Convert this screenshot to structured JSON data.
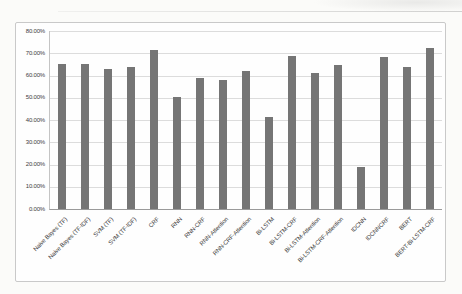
{
  "page": {
    "background": "#fbfbf9"
  },
  "chart": {
    "frame_border_color": "#c9c9c9",
    "plot_background": "#fefefe",
    "bar_color": "#757575",
    "gridline_color": "#dcdcdc",
    "axis_line_color": "#9a9a9a",
    "text_color": "#3d3d3d"
  },
  "chart_data": {
    "type": "bar",
    "title": "",
    "xlabel": "",
    "ylabel": "",
    "categories": [
      "Naive Bayes (TF)",
      "Naive Bayes (TF-IDF)",
      "SVM (TF)",
      "SVM (TF-IDF)",
      "CRF",
      "RNN",
      "RNN-CRF",
      "RNN-Attention",
      "RNN-CRF-Attention",
      "Bi-LSTM",
      "Bi-LSTM-CRF",
      "Bi-LSTM-Attention",
      "Bi-LSTM-CRF-Attention",
      "IDCNN",
      "IDCNNCRF",
      "BERT",
      "BERT-Bi-LSTM-CRF"
    ],
    "values": [
      65.0,
      65.2,
      62.8,
      63.8,
      71.5,
      50.5,
      58.8,
      58.2,
      62.0,
      41.2,
      68.8,
      61.2,
      64.5,
      18.8,
      68.2,
      63.7,
      72.5
    ],
    "unit": "%",
    "ylim": [
      0,
      80
    ],
    "ytick_step": 10,
    "ytick_labels": [
      "0.00%",
      "10.00%",
      "20.00%",
      "30.00%",
      "40.00%",
      "50.00%",
      "60.00%",
      "70.00%",
      "80.00%"
    ],
    "grid": true,
    "legend": false
  }
}
